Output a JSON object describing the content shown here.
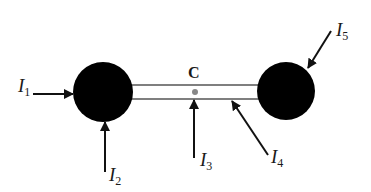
{
  "diagram": {
    "colors": {
      "sphere": "#000000",
      "rod": "#555555",
      "center_dot": "#888888",
      "arrow": "#111111",
      "text": "#1a1a1a"
    },
    "center_point": {
      "label": "C"
    },
    "arrows": [
      {
        "id": "I1",
        "symbol": "I",
        "subscript": "1"
      },
      {
        "id": "I2",
        "symbol": "I",
        "subscript": "2"
      },
      {
        "id": "I3",
        "symbol": "I",
        "subscript": "3"
      },
      {
        "id": "I4",
        "symbol": "I",
        "subscript": "4"
      },
      {
        "id": "I5",
        "symbol": "I",
        "subscript": "5"
      }
    ]
  }
}
